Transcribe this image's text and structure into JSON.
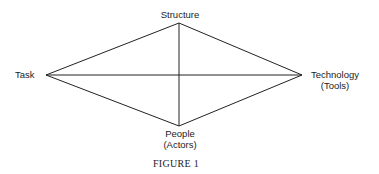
{
  "diagram": {
    "nodes": [
      {
        "id": "structure",
        "label": "Structure",
        "sublabel": ""
      },
      {
        "id": "task",
        "label": "Task",
        "sublabel": ""
      },
      {
        "id": "technology",
        "label": "Technology",
        "sublabel": "(Tools)"
      },
      {
        "id": "people",
        "label": "People",
        "sublabel": "(Actors)"
      }
    ],
    "edges": [
      [
        "task",
        "structure"
      ],
      [
        "structure",
        "technology"
      ],
      [
        "technology",
        "people"
      ],
      [
        "people",
        "task"
      ],
      [
        "task",
        "technology"
      ],
      [
        "structure",
        "people"
      ]
    ],
    "caption": "FIGURE 1"
  }
}
